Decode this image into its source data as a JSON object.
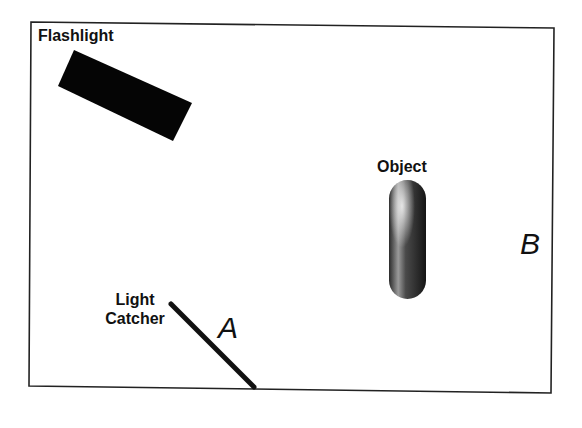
{
  "diagram": {
    "frame": {
      "stroke": "#222222"
    },
    "flashlight": {
      "label": "Flashlight",
      "color": "#050505"
    },
    "object": {
      "label": "Object"
    },
    "light_catcher": {
      "label_line1": "Light",
      "label_line2": "Catcher"
    },
    "points": {
      "a": "A",
      "b": "B"
    }
  }
}
